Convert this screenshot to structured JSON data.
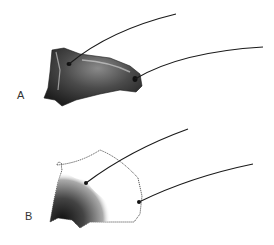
{
  "figure": {
    "panels": [
      {
        "label": "A",
        "description": "stippled segment with two setae"
      },
      {
        "label": "B",
        "description": "outlined segment with partial stippling and two setae"
      }
    ],
    "colors": {
      "ink": "#1a1a1a",
      "stipple_dark": "#2a2a2a",
      "stipple_mid": "#555555",
      "background": "#ffffff"
    }
  }
}
